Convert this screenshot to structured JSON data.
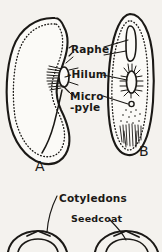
{
  "figure": {
    "background_color": "#f4f2ee",
    "ink_color": "#1b1916"
  },
  "labels": {
    "raphe": "Raphe",
    "hilum": "-Hilum",
    "micro": "Micro",
    "pyle": "-pyle",
    "cotyledons": "Cotyledons",
    "seedcoat": "Seedcoat"
  },
  "captions": {
    "fig_a": "A",
    "fig_b": "B"
  },
  "panels": [
    {
      "id": "panel-a",
      "caption": "A",
      "description": "Side view of bean seed showing kidney-shaped outline with dotted inner margin, hilum oval on concave edge, raphe ridge and micropyle"
    },
    {
      "id": "panel-b",
      "caption": "B",
      "description": "Edge view of bean seed showing narrow elliptical outline with raphe groove, hatched hilum, micropyle pore and stippled chalaza region"
    },
    {
      "id": "panel-c",
      "caption": "",
      "description": "Lower partial figure of split seed halves with cotyledons and seedcoat labelled"
    }
  ]
}
